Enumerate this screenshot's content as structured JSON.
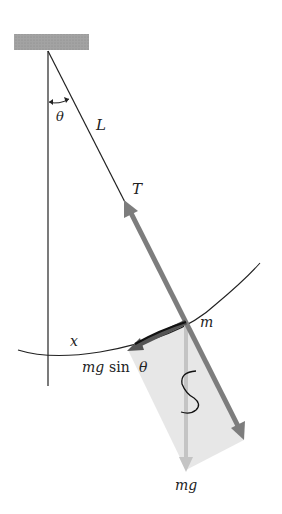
{
  "diagram": {
    "labels": {
      "theta": "θ",
      "length": "L",
      "tension": "T",
      "mass": "m",
      "displacement": "x",
      "restoring_force_mg": "mg",
      "restoring_force_sin": "sin",
      "restoring_force_theta": "θ",
      "weight": "mg"
    },
    "colors": {
      "ceiling": "#9a9a9a",
      "line": "#222222",
      "tension_arrow": "#7d7d7d",
      "weight_arrow": "#c4c4c4",
      "component_box": "#e6e6e6",
      "background": "#ffffff"
    }
  }
}
